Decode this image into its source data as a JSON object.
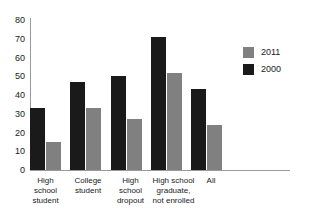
{
  "chart_data": {
    "type": "bar",
    "title": "",
    "xlabel": "",
    "ylabel": "",
    "ylim": [
      0,
      80
    ],
    "ytick_step": 10,
    "yticks": [
      0,
      10,
      20,
      30,
      40,
      50,
      60,
      70,
      80
    ],
    "grid": false,
    "legend_position": "top-right",
    "categories": [
      "High school student",
      "College student",
      "High school dropout",
      "High school graduate, not enrolled",
      "All"
    ],
    "category_lines": [
      [
        "High",
        "school",
        "student"
      ],
      [
        "College",
        "student"
      ],
      [
        "High",
        "school",
        "dropout"
      ],
      [
        "High school",
        "graduate,",
        "not enrolled"
      ],
      [
        "All"
      ]
    ],
    "series": [
      {
        "name": "2000",
        "color": "#1a1a1a",
        "values": [
          33,
          47,
          50,
          71,
          43
        ]
      },
      {
        "name": "2011",
        "color": "#808080",
        "values": [
          15,
          33,
          27,
          52,
          24
        ]
      }
    ]
  },
  "legend": {
    "entries": [
      {
        "label": "2011",
        "color": "#808080"
      },
      {
        "label": "2000",
        "color": "#1a1a1a"
      }
    ]
  },
  "axes": {
    "y_tick_labels": [
      "80",
      "70",
      "60",
      "50",
      "40",
      "30",
      "20",
      "10",
      "0"
    ]
  },
  "colors": {
    "series_2000": "#1a1a1a",
    "series_2011": "#808080",
    "axis": "#999999",
    "background": "#ffffff",
    "text": "#1a1a1a"
  }
}
